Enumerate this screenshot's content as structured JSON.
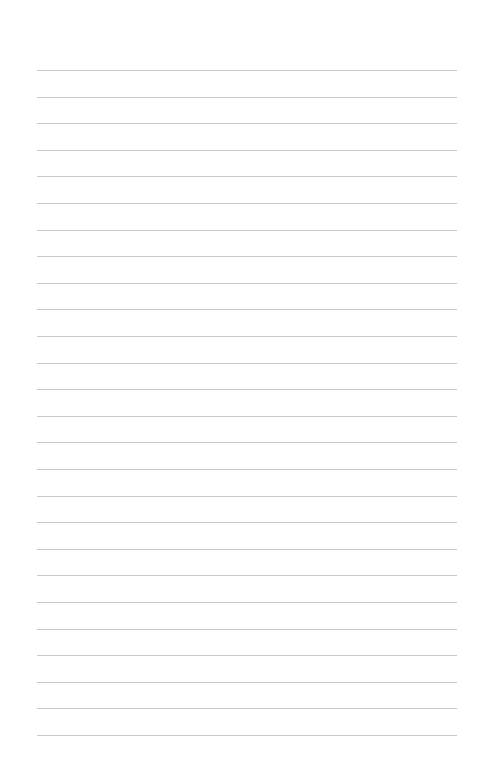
{
  "page": {
    "type": "blank-ruled-paper",
    "background_color": "#ffffff",
    "rule_color": "#c9c9c9",
    "rule_count": 26,
    "rule_start_y": 70,
    "rule_spacing": 26.6,
    "rule_left": 37,
    "rule_width": 420
  },
  "lines": [
    {
      "text": ""
    },
    {
      "text": ""
    },
    {
      "text": ""
    },
    {
      "text": ""
    },
    {
      "text": ""
    },
    {
      "text": ""
    },
    {
      "text": ""
    },
    {
      "text": ""
    },
    {
      "text": ""
    },
    {
      "text": ""
    },
    {
      "text": ""
    },
    {
      "text": ""
    },
    {
      "text": ""
    },
    {
      "text": ""
    },
    {
      "text": ""
    },
    {
      "text": ""
    },
    {
      "text": ""
    },
    {
      "text": ""
    },
    {
      "text": ""
    },
    {
      "text": ""
    },
    {
      "text": ""
    },
    {
      "text": ""
    },
    {
      "text": ""
    },
    {
      "text": ""
    },
    {
      "text": ""
    },
    {
      "text": ""
    }
  ]
}
